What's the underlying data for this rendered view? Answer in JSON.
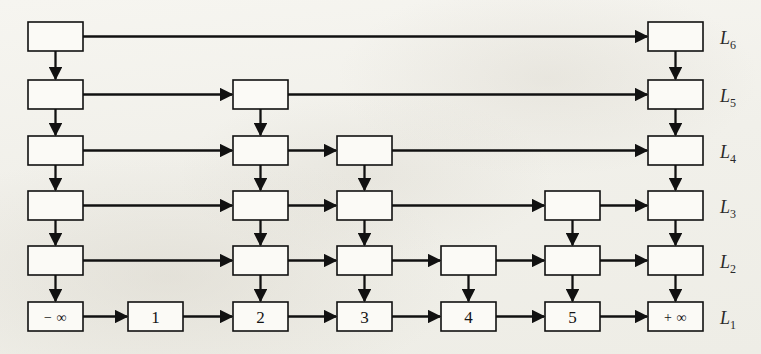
{
  "figure": {
    "name": "skip-list-diagram",
    "type": "skip-list",
    "background_color": "#f2f1ec",
    "ink_color": "#111111",
    "box_fill": "#fbfaf6"
  },
  "levels": [
    {
      "id": "L6",
      "label": "L",
      "subscript": "6",
      "row": 0,
      "y": 22
    },
    {
      "id": "L5",
      "label": "L",
      "subscript": "5",
      "row": 1,
      "y": 80
    },
    {
      "id": "L4",
      "label": "L",
      "subscript": "4",
      "row": 2,
      "y": 136
    },
    {
      "id": "L3",
      "label": "L",
      "subscript": "3",
      "row": 3,
      "y": 191
    },
    {
      "id": "L2",
      "label": "L",
      "subscript": "2",
      "row": 4,
      "y": 246
    },
    {
      "id": "L1",
      "label": "L",
      "subscript": "1",
      "row": 5,
      "y": 302
    }
  ],
  "columns": [
    {
      "id": "neg-inf",
      "key": "-∞",
      "x": 28,
      "height": 6,
      "base_label": "− ∞"
    },
    {
      "id": "node-1",
      "key": "1",
      "x": 128,
      "height": 1,
      "base_label": "1"
    },
    {
      "id": "node-2",
      "key": "2",
      "x": 233,
      "height": 5,
      "base_label": "2"
    },
    {
      "id": "node-3",
      "key": "3",
      "x": 337,
      "height": 4,
      "base_label": "3"
    },
    {
      "id": "node-4",
      "key": "4",
      "x": 441,
      "height": 2,
      "base_label": "4"
    },
    {
      "id": "node-5",
      "key": "5",
      "x": 545,
      "height": 3,
      "base_label": "5"
    },
    {
      "id": "pos-inf",
      "key": "+∞",
      "x": 648,
      "height": 6,
      "base_label": "+ ∞"
    }
  ],
  "geometry": {
    "box_width": 55,
    "box_height": 29,
    "row_y": [
      22,
      80,
      136,
      191,
      246,
      302
    ],
    "level_label_x": 720
  },
  "horizontal_links": [
    {
      "level": "L6",
      "from": "neg-inf",
      "to": "pos-inf"
    },
    {
      "level": "L5",
      "from": "neg-inf",
      "to": "node-2"
    },
    {
      "level": "L5",
      "from": "node-2",
      "to": "pos-inf"
    },
    {
      "level": "L4",
      "from": "neg-inf",
      "to": "node-2"
    },
    {
      "level": "L4",
      "from": "node-2",
      "to": "node-3"
    },
    {
      "level": "L4",
      "from": "node-3",
      "to": "pos-inf"
    },
    {
      "level": "L3",
      "from": "neg-inf",
      "to": "node-2"
    },
    {
      "level": "L3",
      "from": "node-2",
      "to": "node-3"
    },
    {
      "level": "L3",
      "from": "node-3",
      "to": "node-5"
    },
    {
      "level": "L3",
      "from": "node-5",
      "to": "pos-inf"
    },
    {
      "level": "L2",
      "from": "neg-inf",
      "to": "node-2"
    },
    {
      "level": "L2",
      "from": "node-2",
      "to": "node-3"
    },
    {
      "level": "L2",
      "from": "node-3",
      "to": "node-4"
    },
    {
      "level": "L2",
      "from": "node-4",
      "to": "node-5"
    },
    {
      "level": "L2",
      "from": "node-5",
      "to": "pos-inf"
    },
    {
      "level": "L1",
      "from": "neg-inf",
      "to": "node-1"
    },
    {
      "level": "L1",
      "from": "node-1",
      "to": "node-2"
    },
    {
      "level": "L1",
      "from": "node-2",
      "to": "node-3"
    },
    {
      "level": "L1",
      "from": "node-3",
      "to": "node-4"
    },
    {
      "level": "L1",
      "from": "node-4",
      "to": "node-5"
    },
    {
      "level": "L1",
      "from": "node-5",
      "to": "pos-inf"
    }
  ],
  "notes": {
    "arrow_direction": "horizontal links point right; vertical links point down",
    "tower_rule": "each column occupies the bottom N levels where N is its height"
  }
}
